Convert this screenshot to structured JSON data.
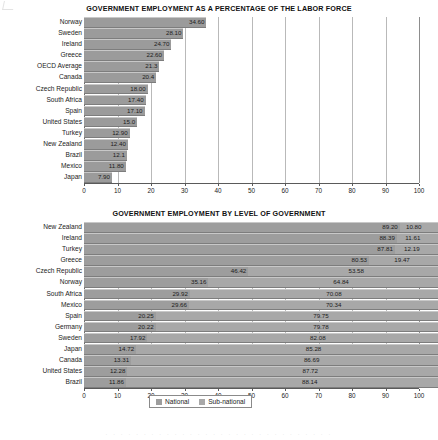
{
  "chart_data": [
    {
      "type": "bar",
      "title": "GOVERNMENT EMPLOYMENT AS A PERCENTAGE OF THE LABOR FORCE",
      "xlabel": "",
      "ylabel": "",
      "xlim": [
        0,
        100
      ],
      "grid": true,
      "orientation": "horizontal",
      "legend": null,
      "ticks": [
        "0",
        "10",
        "20",
        "30",
        "40",
        "50",
        "60",
        "70",
        "80",
        "90",
        "100"
      ],
      "categories": [
        "Norway",
        "Sweden",
        "Ireland",
        "Greece",
        "OECD Average",
        "Canada",
        "Czech Republic",
        "South Africa",
        "Spain",
        "United States",
        "Turkey",
        "New Zealand",
        "Brazil",
        "Mexico",
        "Japan"
      ],
      "values": [
        34.6,
        28.1,
        24.7,
        22.6,
        21.3,
        20.4,
        18.0,
        17.4,
        17.1,
        15.0,
        12.9,
        12.4,
        12.1,
        11.8,
        7.9
      ],
      "labels": [
        "34.60",
        "28.10",
        "24.70",
        "22.60",
        "21.3",
        "20.4",
        "18.00",
        "17.40",
        "17.10",
        "15.0",
        "12.90",
        "12.40",
        "12.1",
        "11.80",
        "7.90"
      ]
    },
    {
      "type": "bar",
      "title": "GOVERNMENT EMPLOYMENT BY LEVEL OF GOVERNMENT",
      "xlabel": "",
      "ylabel": "",
      "xlim": [
        0,
        100
      ],
      "grid": true,
      "orientation": "horizontal",
      "stacked": true,
      "legend": {
        "position": "bottom",
        "entries": [
          "National",
          "Sub-national"
        ]
      },
      "ticks": [
        "0",
        "10",
        "20",
        "30",
        "40",
        "50",
        "60",
        "70",
        "80",
        "90",
        "100"
      ],
      "categories": [
        "New Zealand",
        "Ireland",
        "Turkey",
        "Greece",
        "Czech Republic",
        "Norway",
        "South Africa",
        "Mexico",
        "Spain",
        "Germany",
        "Sweden",
        "Japan",
        "Canada",
        "United States",
        "Brazil"
      ],
      "series": [
        {
          "name": "National",
          "values": [
            89.2,
            88.39,
            87.81,
            80.53,
            46.42,
            35.16,
            29.92,
            29.66,
            20.25,
            20.22,
            17.92,
            14.72,
            13.31,
            12.28,
            11.86
          ],
          "labels": [
            "89.20",
            "88.39",
            "87.81",
            "80.53",
            "46.42",
            "35.16",
            "29.92",
            "29.66",
            "20.25",
            "20.22",
            "17.92",
            "14.72",
            "13.31",
            "12.28",
            "11.86"
          ]
        },
        {
          "name": "Sub-national",
          "values": [
            10.8,
            11.61,
            12.19,
            19.47,
            53.58,
            64.84,
            70.08,
            70.34,
            79.75,
            79.78,
            82.08,
            85.28,
            86.69,
            87.72,
            88.14
          ],
          "labels": [
            "10.80",
            "11.61",
            "12.19",
            "19.47",
            "53.58",
            "64.84",
            "70.08",
            "70.34",
            "79.75",
            "79.78",
            "82.08",
            "85.28",
            "86.69",
            "87.72",
            "88.14"
          ]
        }
      ]
    }
  ],
  "footer": {
    "scrap_text": "· · · · · · · · · · · · · · · · · · · · · · · · · · · · · ·"
  }
}
